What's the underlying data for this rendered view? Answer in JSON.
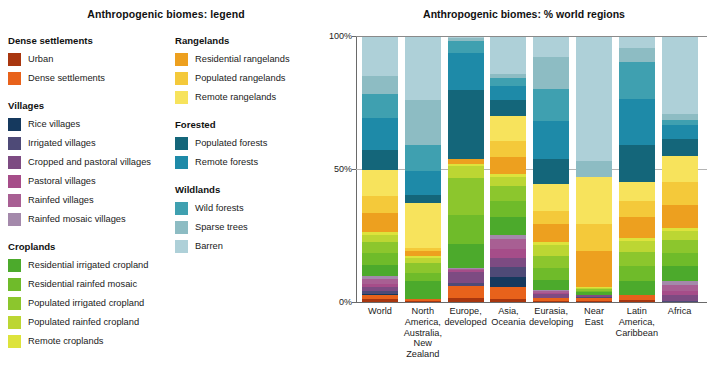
{
  "legend": {
    "title": "Anthropogenic biomes: legend",
    "columns": [
      {
        "groups": [
          {
            "title": "Dense settlements",
            "items": [
              {
                "label": "Urban",
                "color": "#a8360f"
              },
              {
                "label": "Dense settlements",
                "color": "#e8621b"
              }
            ]
          },
          {
            "title": "Villages",
            "items": [
              {
                "label": "Rice villages",
                "color": "#15395e"
              },
              {
                "label": "Irrigated villages",
                "color": "#4e4a77"
              },
              {
                "label": "Cropped and pastoral villages",
                "color": "#7d4b82"
              },
              {
                "label": "Pastoral villages",
                "color": "#a64d89"
              },
              {
                "label": "Rainfed villages",
                "color": "#a85f93"
              },
              {
                "label": "Rainfed mosaic villages",
                "color": "#a489ab"
              }
            ]
          },
          {
            "title": "Croplands",
            "items": [
              {
                "label": "Residential irrigated cropland",
                "color": "#4caa2c"
              },
              {
                "label": "Residential rainfed mosaic",
                "color": "#6fbb2a"
              },
              {
                "label": "Populated irrigated cropland",
                "color": "#8cc62d"
              },
              {
                "label": "Populated rainfed cropland",
                "color": "#bcd633"
              },
              {
                "label": "Remote croplands",
                "color": "#dde33c"
              }
            ]
          }
        ]
      },
      {
        "groups": [
          {
            "title": "Rangelands",
            "items": [
              {
                "label": "Residential rangelands",
                "color": "#eda01f"
              },
              {
                "label": "Populated rangelands",
                "color": "#f4c93a"
              },
              {
                "label": "Remote rangelands",
                "color": "#f7e35c"
              }
            ]
          },
          {
            "title": "Forested",
            "items": [
              {
                "label": "Populated forests",
                "color": "#14667a"
              },
              {
                "label": "Remote forests",
                "color": "#1e8aa8"
              }
            ]
          },
          {
            "title": "Wildlands",
            "items": [
              {
                "label": "Wild forests",
                "color": "#3fa0b0"
              },
              {
                "label": "Sparse trees",
                "color": "#8dbcc3"
              },
              {
                "label": "Barren",
                "color": "#aed0d8"
              }
            ]
          }
        ]
      }
    ]
  },
  "chart_data": {
    "type": "bar",
    "stacked": true,
    "stack_normalized": true,
    "title": "Anthropogenic biomes: % world regions",
    "xlabel": "",
    "ylabel": "",
    "ylim": [
      0,
      100
    ],
    "yticks": [
      0,
      50,
      100
    ],
    "ytick_labels": [
      "0%",
      "50%",
      "100%"
    ],
    "grid": true,
    "legend_position": "external-left",
    "categories": [
      "World",
      "North America, Australia, New Zealand",
      "Europe, developed",
      "Asia, Oceania",
      "Eurasia, developing",
      "Near East",
      "Latin America, Caribbean",
      "Africa"
    ],
    "category_label_lines": [
      [
        "World"
      ],
      [
        "North",
        "America,",
        "Australia,",
        "New Zealand"
      ],
      [
        "Europe,",
        "developed"
      ],
      [
        "Asia,",
        "Oceania"
      ],
      [
        "Eurasia,",
        "developing"
      ],
      [
        "Near",
        "East"
      ],
      [
        "Latin",
        "America,",
        "Caribbean"
      ],
      [
        "Africa"
      ]
    ],
    "series": [
      {
        "name": "Urban",
        "color": "#a8360f",
        "values": [
          1.0,
          0.5,
          1.5,
          1.0,
          0.5,
          0.5,
          0.8,
          0.0
        ]
      },
      {
        "name": "Dense settlements",
        "color": "#e8621b",
        "values": [
          1.5,
          0.8,
          4.5,
          4.5,
          1.0,
          1.2,
          2.0,
          0.0
        ]
      },
      {
        "name": "Rice villages",
        "color": "#15395e",
        "values": [
          0.5,
          0.0,
          0.0,
          4.0,
          0.0,
          0.0,
          0.0,
          0.0
        ]
      },
      {
        "name": "Irrigated villages",
        "color": "#4e4a77",
        "values": [
          1.0,
          0.0,
          1.0,
          3.5,
          0.0,
          0.3,
          0.0,
          0.5
        ]
      },
      {
        "name": "Cropped and pastoral villages",
        "color": "#7d4b82",
        "values": [
          1.5,
          0.0,
          4.5,
          3.5,
          1.5,
          0.8,
          0.0,
          2.0
        ]
      },
      {
        "name": "Pastoral villages",
        "color": "#a64d89",
        "values": [
          1.2,
          0.0,
          0.5,
          3.5,
          0.5,
          0.0,
          0.0,
          1.5
        ]
      },
      {
        "name": "Rainfed villages",
        "color": "#a85f93",
        "values": [
          2.0,
          0.0,
          0.5,
          3.5,
          0.5,
          0.0,
          0.0,
          2.5
        ]
      },
      {
        "name": "Rainfed mosaic villages",
        "color": "#a489ab",
        "values": [
          1.3,
          0.0,
          0.5,
          1.5,
          0.5,
          0.0,
          0.0,
          1.5
        ]
      },
      {
        "name": "Residential irrigated cropland",
        "color": "#4caa2c",
        "values": [
          4.0,
          6.5,
          9.0,
          7.0,
          4.0,
          1.0,
          5.0,
          5.5
        ]
      },
      {
        "name": "Residential rainfed mosaic",
        "color": "#6fbb2a",
        "values": [
          4.5,
          3.0,
          11.0,
          6.0,
          4.5,
          0.5,
          5.5,
          5.0
        ]
      },
      {
        "name": "Populated irrigated cropland",
        "color": "#8cc62d",
        "values": [
          4.0,
          4.0,
          14.0,
          5.5,
          4.5,
          0.5,
          5.5,
          5.0
        ]
      },
      {
        "name": "Populated rainfed cropland",
        "color": "#bcd633",
        "values": [
          3.0,
          2.0,
          4.5,
          3.5,
          4.0,
          0.5,
          4.0,
          3.5
        ]
      },
      {
        "name": "Remote croplands",
        "color": "#dde33c",
        "values": [
          1.0,
          0.5,
          0.5,
          1.0,
          1.0,
          0.5,
          1.0,
          1.0
        ]
      },
      {
        "name": "Residential rangelands",
        "color": "#eda01f",
        "values": [
          7.0,
          2.0,
          2.0,
          6.5,
          7.0,
          13.5,
          8.0,
          9.0
        ]
      },
      {
        "name": "Populated rangelands",
        "color": "#f4c93a",
        "values": [
          6.5,
          1.0,
          0.0,
          6.0,
          5.0,
          10.0,
          6.0,
          8.5
        ]
      },
      {
        "name": "Remote rangelands",
        "color": "#f7e35c",
        "values": [
          10.0,
          17.0,
          0.0,
          9.5,
          10.0,
          18.0,
          7.0,
          10.0
        ]
      },
      {
        "name": "Populated forests",
        "color": "#14667a",
        "values": [
          7.5,
          3.0,
          26.0,
          6.0,
          9.5,
          0.0,
          14.0,
          6.5
        ]
      },
      {
        "name": "Remote forests",
        "color": "#1e8aa8",
        "values": [
          12.0,
          9.0,
          14.0,
          5.0,
          14.5,
          0.0,
          17.0,
          5.0
        ]
      },
      {
        "name": "Wild forests",
        "color": "#3fa0b0",
        "values": [
          9.0,
          10.0,
          4.5,
          3.0,
          12.0,
          0.0,
          14.0,
          2.0
        ]
      },
      {
        "name": "Sparse trees",
        "color": "#8dbcc3",
        "values": [
          7.0,
          17.0,
          1.0,
          1.5,
          12.0,
          6.0,
          5.0,
          2.5
        ]
      },
      {
        "name": "Barren",
        "color": "#aed0d8",
        "values": [
          14.5,
          23.7,
          0.5,
          14.0,
          7.5,
          46.7,
          4.2,
          29.0
        ]
      }
    ]
  }
}
